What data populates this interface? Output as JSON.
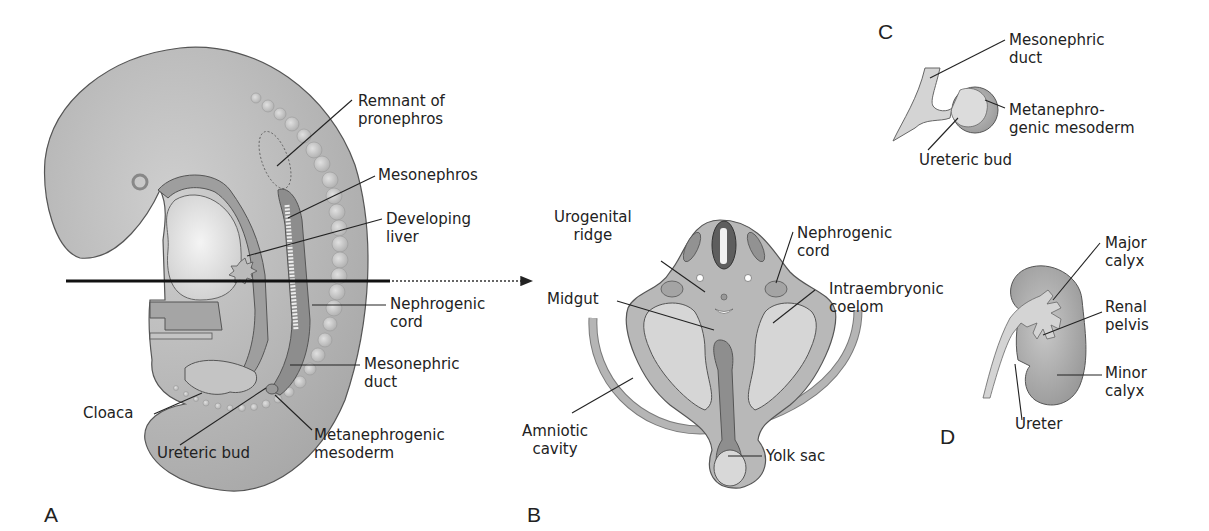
{
  "panels": {
    "A": {
      "letter": "A",
      "labels": {
        "remnant_pronephros": "Remnant of\npronephros",
        "mesonephros": "Mesonephros",
        "developing_liver": "Developing\nliver",
        "nephrogenic_cord": "Nephrogenic\ncord",
        "mesonephric_duct": "Mesonephric\nduct",
        "cloaca": "Cloaca",
        "ureteric_bud": "Ureteric bud",
        "metanephrogenic_mesoderm": "Metanephrogenic\nmesoderm"
      }
    },
    "B": {
      "letter": "B",
      "labels": {
        "urogenital_ridge": "Urogenital\nridge",
        "nephrogenic_cord": "Nephrogenic\ncord",
        "midgut": "Midgut",
        "intraembryonic_coelom": "Intraembryonic\ncoelom",
        "amniotic_cavity": "Amniotic\ncavity",
        "yolk_sac": "Yolk sac"
      }
    },
    "C": {
      "letter": "C",
      "labels": {
        "mesonephric_duct": "Mesonephric\nduct",
        "metanephrogenic_mesoderm": "Metanephro-\ngenic mesoderm",
        "ureteric_bud": "Ureteric bud"
      }
    },
    "D": {
      "letter": "D",
      "labels": {
        "major_calyx": "Major\ncalyx",
        "renal_pelvis": "Renal\npelvis",
        "minor_calyx": "Minor\ncalyx",
        "ureter": "Ureter"
      }
    }
  },
  "colors": {
    "tissue_light": "#d4d4d4",
    "tissue_mid": "#b2b2b2",
    "tissue_dark": "#8c8c8c",
    "neural_tube": "#6a6a6a",
    "outline": "#555555",
    "leader": "#222222"
  }
}
